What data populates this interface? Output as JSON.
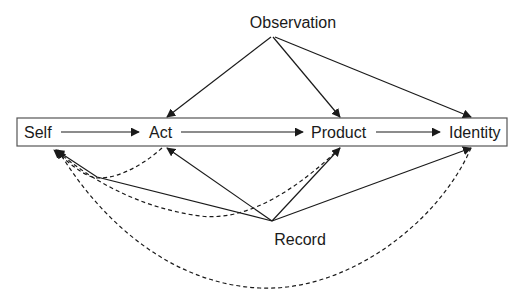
{
  "diagram": {
    "type": "flow-diagram",
    "nodes": {
      "self": "Self",
      "act": "Act",
      "product": "Product",
      "identity": "Identity",
      "observation": "Observation",
      "record": "Record"
    },
    "edges": [
      {
        "from": "Self",
        "to": "Act",
        "style": "solid"
      },
      {
        "from": "Act",
        "to": "Product",
        "style": "solid"
      },
      {
        "from": "Product",
        "to": "Identity",
        "style": "solid"
      },
      {
        "from": "Observation",
        "to": "Act",
        "style": "solid"
      },
      {
        "from": "Observation",
        "to": "Product",
        "style": "solid"
      },
      {
        "from": "Observation",
        "to": "Identity",
        "style": "solid"
      },
      {
        "from": "Record",
        "to": "Act",
        "style": "solid"
      },
      {
        "from": "Record",
        "to": "Product",
        "style": "solid"
      },
      {
        "from": "Record",
        "to": "Identity",
        "style": "solid"
      },
      {
        "from": "Record",
        "to": "Self",
        "style": "solid"
      },
      {
        "from": "Act",
        "to": "Self",
        "style": "dashed"
      },
      {
        "from": "Product",
        "to": "Self",
        "style": "dashed"
      },
      {
        "from": "Identity",
        "to": "Self",
        "style": "dashed"
      }
    ],
    "colors": {
      "stroke": "#1a1a1a",
      "frame": "#555555",
      "background": "#ffffff"
    }
  }
}
